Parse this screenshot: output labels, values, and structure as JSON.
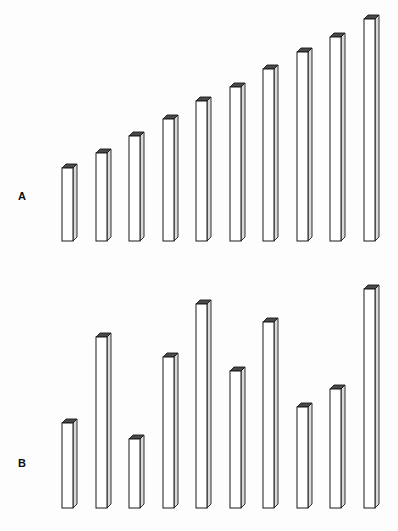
{
  "figure": {
    "title": "",
    "background_color": "#fdfdfd",
    "bar_fill_color": "#ffffff",
    "bar_stroke_color": "#1a1a1a",
    "bar_top_face_color": "#4a4a4a",
    "bar_side_face_color": "#d9d9d9"
  },
  "panels": [
    {
      "id": "A",
      "label": "A",
      "label_x": 18,
      "label_y": 190,
      "baseline_y": 241,
      "bar_left_start": 62,
      "bar_spacing": 33.5,
      "bar_width": 11,
      "depth": 4
    },
    {
      "id": "B",
      "label": "B",
      "label_x": 18,
      "label_y": 457,
      "baseline_y": 508,
      "bar_left_start": 62,
      "bar_spacing": 33.5,
      "bar_width": 11,
      "depth": 4
    }
  ],
  "chart_data": [
    {
      "type": "bar",
      "title": "A",
      "xlabel": "",
      "ylabel": "",
      "grid": false,
      "legend": "none",
      "orientation": "vertical",
      "style": "3d-isometric-bars",
      "categories": [
        "1",
        "2",
        "3",
        "4",
        "5",
        "6",
        "7",
        "8",
        "9",
        "10"
      ],
      "values": [
        73,
        88,
        105,
        122,
        140,
        154,
        172,
        189,
        204,
        222
      ],
      "ylim": [
        0,
        230
      ],
      "baseline_y_px": 241,
      "bar_top_y_px": [
        168,
        153,
        136,
        119,
        101,
        87,
        69,
        52,
        37,
        19
      ],
      "bar_left_x_px": [
        62,
        96,
        129,
        163,
        196,
        230,
        263,
        297,
        330,
        364
      ],
      "pattern": "monotonically increasing"
    },
    {
      "type": "bar",
      "title": "B",
      "xlabel": "",
      "ylabel": "",
      "grid": false,
      "legend": "none",
      "orientation": "vertical",
      "style": "3d-isometric-bars",
      "categories": [
        "1",
        "2",
        "3",
        "4",
        "5",
        "6",
        "7",
        "8",
        "9",
        "10"
      ],
      "values": [
        85,
        171,
        69,
        151,
        204,
        137,
        186,
        101,
        119,
        219
      ],
      "ylim": [
        0,
        230
      ],
      "baseline_y_px": 508,
      "bar_top_y_px": [
        423,
        337,
        439,
        357,
        304,
        371,
        322,
        407,
        389,
        289
      ],
      "bar_left_x_px": [
        62,
        96,
        129,
        163,
        196,
        230,
        263,
        297,
        330,
        364
      ],
      "pattern": "irregular / non-monotonic"
    }
  ]
}
